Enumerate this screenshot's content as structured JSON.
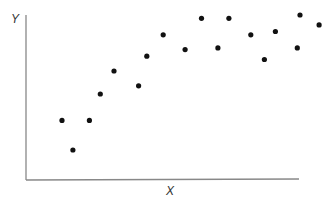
{
  "chart_data": {
    "type": "scatter",
    "title": "",
    "xlabel": "X",
    "ylabel": "Y",
    "grid": false,
    "legend": null,
    "axis_ticks": "none",
    "note": "Values in plot pixel space normalized 0-100 (no tick labels shown).",
    "xlim": [
      0,
      100
    ],
    "ylim": [
      0,
      100
    ],
    "points": [
      {
        "x": 13,
        "y": 36
      },
      {
        "x": 17,
        "y": 18
      },
      {
        "x": 23,
        "y": 36
      },
      {
        "x": 27,
        "y": 52
      },
      {
        "x": 32,
        "y": 66
      },
      {
        "x": 41,
        "y": 57
      },
      {
        "x": 44,
        "y": 75
      },
      {
        "x": 50,
        "y": 88
      },
      {
        "x": 58,
        "y": 79
      },
      {
        "x": 64,
        "y": 98
      },
      {
        "x": 70,
        "y": 80
      },
      {
        "x": 74,
        "y": 98
      },
      {
        "x": 82,
        "y": 88
      },
      {
        "x": 87,
        "y": 73
      },
      {
        "x": 91,
        "y": 90
      },
      {
        "x": 99,
        "y": 80
      },
      {
        "x": 100,
        "y": 100
      },
      {
        "x": 107,
        "y": 94
      }
    ],
    "colors": {
      "point": "#111111",
      "axis": "#888888",
      "label": "#333333"
    }
  }
}
